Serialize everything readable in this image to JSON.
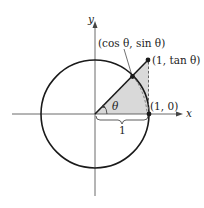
{
  "diagram": {
    "type": "unit-circle-tangent",
    "axes": {
      "x_label": "x",
      "y_label": "y"
    },
    "labels": {
      "cos_sin_point": "(cos θ, sin θ)",
      "tan_point": "(1, tan θ)",
      "unit_point": "(1, 0)",
      "angle": "θ",
      "radius_length": "1"
    },
    "colors": {
      "stroke": "#1a1a1a",
      "shade": "#d9d9d9",
      "dashed": "#555555",
      "background": "#ffffff"
    }
  }
}
